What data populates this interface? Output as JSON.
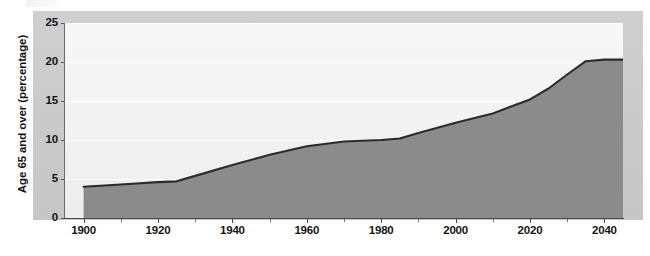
{
  "chart_data": {
    "type": "area",
    "title": "",
    "subtitle": "",
    "xlabel": "",
    "ylabel": "Age 65 and over (percentage)",
    "xlim": [
      1895,
      2045
    ],
    "ylim": [
      0,
      25
    ],
    "grid": true,
    "legend": "none",
    "y_ticks": [
      0,
      5,
      10,
      15,
      20,
      25
    ],
    "y_tick_labels": [
      "0",
      "5",
      "10",
      "15",
      "20",
      "25"
    ],
    "x_ticks_major": [
      1900,
      1920,
      1940,
      1960,
      1980,
      2000,
      2020,
      2040
    ],
    "x_tick_labels": [
      "1900",
      "1920",
      "1940",
      "1960",
      "1980",
      "2000",
      "2020",
      "2040"
    ],
    "x_ticks_minor": [
      1910,
      1930,
      1950,
      1970,
      1990,
      2010,
      2030
    ],
    "series": [
      {
        "name": "Age 65 and over (percentage)",
        "x": [
          1900,
          1910,
          1920,
          1925,
          1930,
          1940,
          1950,
          1960,
          1970,
          1980,
          1985,
          1990,
          2000,
          2010,
          2020,
          2025,
          2030,
          2035,
          2040,
          2045
        ],
        "values": [
          4.0,
          4.3,
          4.6,
          4.7,
          5.4,
          6.8,
          8.1,
          9.2,
          9.8,
          10.0,
          10.2,
          10.9,
          12.2,
          13.4,
          15.2,
          16.6,
          18.4,
          20.1,
          20.3,
          20.3
        ]
      }
    ],
    "colors": {
      "fill": "#8b8b8b",
      "line": "#2b2b2b",
      "plot_background": "#f4f4f4",
      "panel_background": "#c9c9c9",
      "gridline": "#ffffff",
      "text": "#141414"
    }
  }
}
